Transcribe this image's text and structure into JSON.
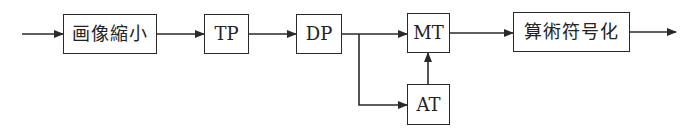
{
  "diagram": {
    "type": "block-diagram",
    "nodes": [
      {
        "id": "shrink",
        "label": "画像縮小"
      },
      {
        "id": "tp",
        "label": "TP"
      },
      {
        "id": "dp",
        "label": "DP"
      },
      {
        "id": "mt",
        "label": "MT"
      },
      {
        "id": "at",
        "label": "AT"
      },
      {
        "id": "arith",
        "label": "算術符号化"
      }
    ],
    "edges": [
      {
        "from": "input",
        "to": "shrink"
      },
      {
        "from": "shrink",
        "to": "tp"
      },
      {
        "from": "tp",
        "to": "dp"
      },
      {
        "from": "dp",
        "to": "mt"
      },
      {
        "from": "dp",
        "to": "at"
      },
      {
        "from": "at",
        "to": "mt"
      },
      {
        "from": "mt",
        "to": "arith"
      },
      {
        "from": "arith",
        "to": "output"
      }
    ],
    "colors": {
      "line": "#2a2a2a",
      "background": "#ffffff"
    }
  }
}
